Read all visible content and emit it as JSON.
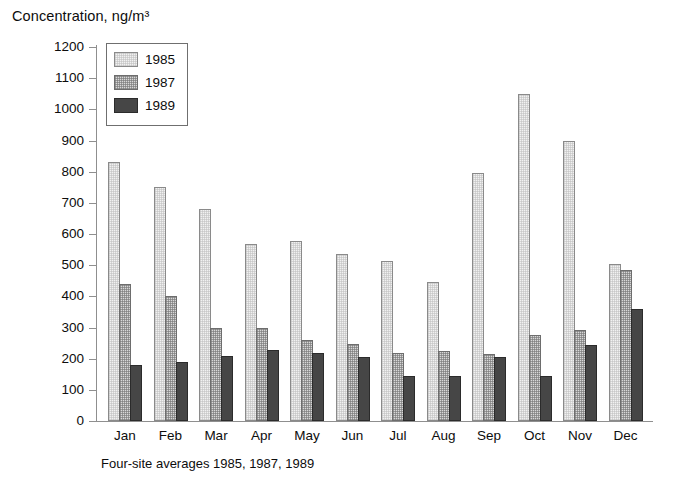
{
  "chart_data": {
    "type": "bar",
    "title": "Concentration, ng/m³",
    "subtitle": "Four-site averages 1985, 1987, 1989",
    "xlabel": "",
    "ylabel": "Concentration, ng/m³",
    "ylim": [
      0,
      1200
    ],
    "ytick_step": 100,
    "yticks": [
      1200,
      1100,
      1000,
      900,
      800,
      700,
      600,
      500,
      400,
      300,
      200,
      100,
      0
    ],
    "ytick_labels": [
      "1200",
      "1100",
      "1000",
      "900",
      "800",
      "700",
      "600",
      "500",
      "400",
      "300",
      "200",
      "100",
      "0"
    ],
    "grid": false,
    "legend_position": "upper-left-inside",
    "categories": [
      "Jan",
      "Feb",
      "Mar",
      "Apr",
      "May",
      "Jun",
      "Jul",
      "Aug",
      "Sep",
      "Oct",
      "Nov",
      "Dec"
    ],
    "series": [
      {
        "name": "1985",
        "color": "#f1f1f1",
        "pattern": "light-stipple",
        "values": [
          830,
          750,
          680,
          567,
          577,
          537,
          515,
          445,
          795,
          1050,
          900,
          505
        ]
      },
      {
        "name": "1987",
        "color": "#d8d8d8",
        "pattern": "checker",
        "values": [
          440,
          400,
          298,
          298,
          260,
          248,
          217,
          225,
          215,
          275,
          293,
          485
        ]
      },
      {
        "name": "1989",
        "color": "#464646",
        "pattern": "solid",
        "values": [
          180,
          190,
          210,
          227,
          217,
          207,
          145,
          145,
          205,
          145,
          243,
          360
        ]
      }
    ]
  },
  "legend": {
    "items": [
      {
        "label": "1985"
      },
      {
        "label": "1987"
      },
      {
        "label": "1989"
      }
    ]
  }
}
